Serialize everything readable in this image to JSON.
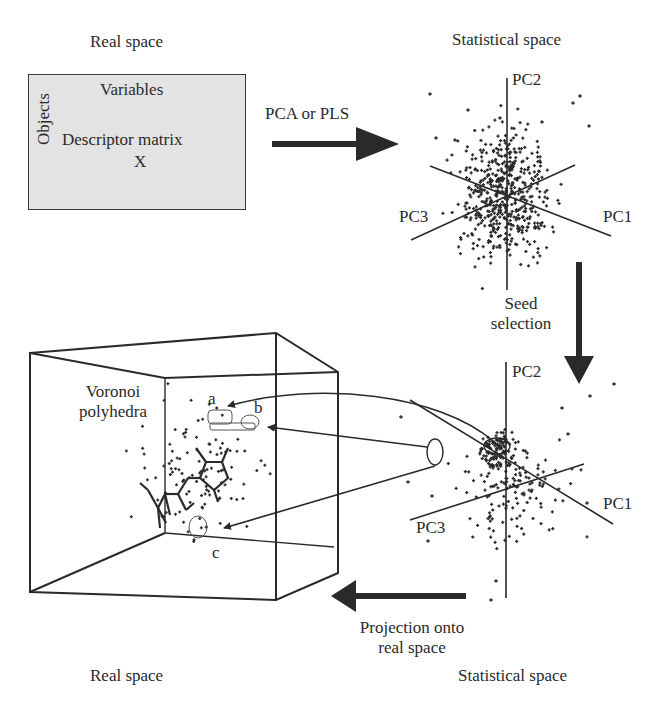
{
  "top_left": {
    "title": "Real space",
    "matrix": {
      "columns_label": "Variables",
      "rows_label": "Objects",
      "name": "Descriptor matrix",
      "symbol": "X"
    }
  },
  "transform_arrow": {
    "label": "PCA or PLS"
  },
  "top_right": {
    "title": "Statistical space",
    "axes": [
      "PC1",
      "PC2",
      "PC3"
    ]
  },
  "seed_arrow": {
    "label_line1": "Seed",
    "label_line2": "selection"
  },
  "bottom_right": {
    "title": "Statistical space",
    "axes": [
      "PC1",
      "PC2",
      "PC3"
    ]
  },
  "projection_arrow": {
    "label_line1": "Projection onto",
    "label_line2": "real space"
  },
  "bottom_left": {
    "title": "Real space",
    "region_label_line1": "Voronoi",
    "region_label_line2": "polyhedra",
    "markers": [
      "a",
      "b",
      "c"
    ]
  },
  "colors": {
    "ink": "#2a2a2a",
    "matrix_fill": "#e3e3e3"
  }
}
